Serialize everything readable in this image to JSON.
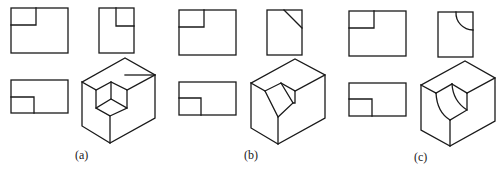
{
  "figure": {
    "panels": [
      {
        "id": "a",
        "label": "(a)",
        "variant": "rectangular-corner-notch",
        "views": [
          "front-view",
          "side-view",
          "top-view",
          "isometric-view"
        ]
      },
      {
        "id": "b",
        "label": "(b)",
        "variant": "chamfered-corner-notch",
        "views": [
          "front-view",
          "side-view",
          "top-view",
          "isometric-view"
        ]
      },
      {
        "id": "c",
        "label": "(c)",
        "variant": "rounded-corner-notch",
        "views": [
          "front-view",
          "side-view",
          "top-view",
          "isometric-view"
        ]
      }
    ],
    "stroke_color": "#1a1a1a",
    "background_color": "#ffffff"
  }
}
